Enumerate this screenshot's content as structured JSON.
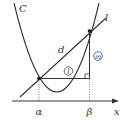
{
  "diagram": {
    "labels": {
      "curve": "C",
      "line": "l",
      "distance": "d",
      "horizontal_leg": "l",
      "vertical_leg": "m",
      "root_left": "α",
      "root_right": "β",
      "axis": "x"
    },
    "elements": {
      "curve": "parabola C",
      "line": "line l intersecting C at x=α and x=β",
      "segment_d": "segment of l between intersection points",
      "horizontal_leg": "horizontal segment from α-point to below β-point (circled l)",
      "vertical_leg": "vertical segment up to β-point (circled m)",
      "right_angle_marker": true,
      "dotted_drop_lines": 2
    },
    "colors": {
      "stroke": "#333333",
      "background": "#ffffff"
    }
  }
}
